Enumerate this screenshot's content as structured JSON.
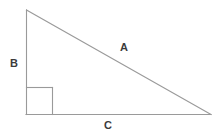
{
  "figure": {
    "background_color": "#ffffff",
    "stroke_color": "#9a9a9a",
    "text_color": "#3b3b3b",
    "stroke_width": 1,
    "width": 217,
    "height": 137
  },
  "geometry": {
    "apex": {
      "x": 26,
      "y": 10
    },
    "bottom_left": {
      "x": 26,
      "y": 114
    },
    "bottom_right": {
      "x": 211,
      "y": 114
    },
    "right_angle_marker": {
      "corner": {
        "x": 26,
        "y": 114
      },
      "size": 26,
      "vertical_x": 52,
      "horizontal_y": 88
    }
  },
  "labels": {
    "hypotenuse": "A",
    "vertical_leg": "B",
    "horizontal_leg": "C"
  },
  "chart_data": {
    "type": "diagram",
    "shape": "right-triangle",
    "vertices": [
      {
        "name": "apex",
        "x": 26,
        "y": 10
      },
      {
        "name": "right-angle-vertex",
        "x": 26,
        "y": 114
      },
      {
        "name": "base-right-vertex",
        "x": 211,
        "y": 114
      }
    ],
    "sides": [
      {
        "label": "A",
        "role": "hypotenuse",
        "from": "apex",
        "to": "base-right-vertex",
        "label_position": {
          "x": 124,
          "y": 48
        }
      },
      {
        "label": "B",
        "role": "vertical-leg",
        "from": "apex",
        "to": "right-angle-vertex",
        "label_position": {
          "x": 14,
          "y": 64
        }
      },
      {
        "label": "C",
        "role": "horizontal-leg",
        "from": "right-angle-vertex",
        "to": "base-right-vertex",
        "label_position": {
          "x": 108,
          "y": 126
        }
      }
    ],
    "annotations": [
      {
        "type": "right-angle-square",
        "at_vertex": "right-angle-vertex",
        "size": 26
      }
    ],
    "legend": "none",
    "grid": false
  }
}
